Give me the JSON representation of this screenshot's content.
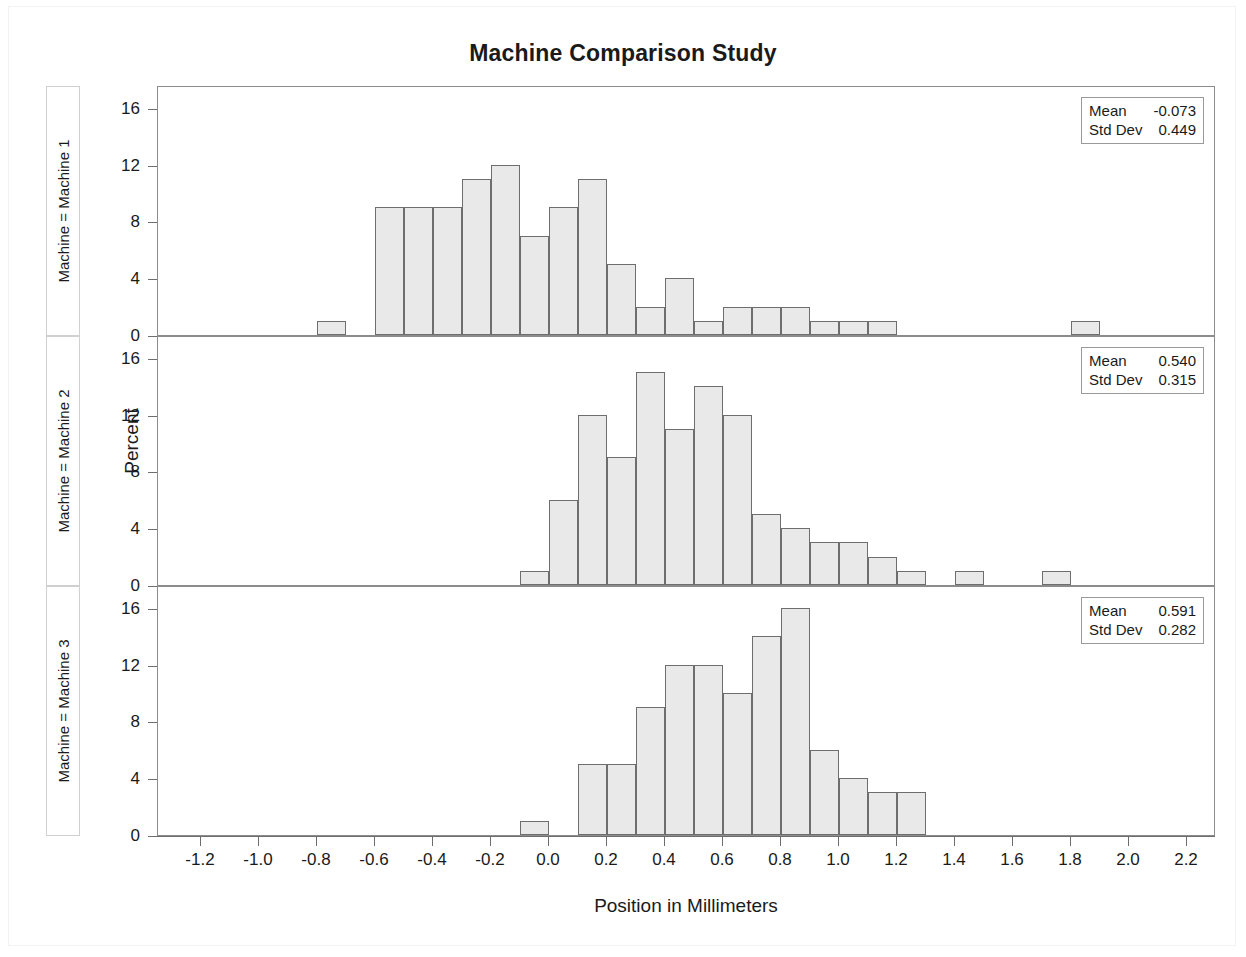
{
  "chart_data": {
    "type": "bar",
    "title": "Machine Comparison Study",
    "xlabel": "Position in Millimeters",
    "ylabel": "Percent",
    "xlim": [
      -1.35,
      2.3
    ],
    "ylim": [
      0,
      17.6
    ],
    "grid": false,
    "legend": "none",
    "bin_width": 0.1,
    "xticks": [
      "-1.2",
      "-1.0",
      "-0.8",
      "-0.6",
      "-0.4",
      "-0.2",
      "0.0",
      "0.2",
      "0.4",
      "0.6",
      "0.8",
      "1.0",
      "1.2",
      "1.4",
      "1.6",
      "1.8",
      "2.0",
      "2.2"
    ],
    "xtick_values": [
      -1.2,
      -1.0,
      -0.8,
      -0.6,
      -0.4,
      -0.2,
      0.0,
      0.2,
      0.4,
      0.6,
      0.8,
      1.0,
      1.2,
      1.4,
      1.6,
      1.8,
      2.0,
      2.2
    ],
    "yticks": [
      "0",
      "4",
      "8",
      "12",
      "16"
    ],
    "ytick_values": [
      0,
      4,
      8,
      12,
      16
    ],
    "panels": [
      {
        "row_label": "Machine = Machine 1",
        "stats": {
          "mean_label": "Mean",
          "mean_value": "-0.073",
          "sd_label": "Std Dev",
          "sd_value": "0.449"
        },
        "bin_centers": [
          -0.75,
          -0.55,
          -0.45,
          -0.35,
          -0.25,
          -0.15,
          -0.05,
          0.05,
          0.15,
          0.25,
          0.35,
          0.45,
          0.55,
          0.65,
          0.75,
          0.85,
          0.95,
          1.05,
          1.15,
          1.85
        ],
        "values": [
          1,
          9,
          9,
          9,
          11,
          12,
          7,
          9,
          11,
          5,
          2,
          4,
          1,
          2,
          2,
          2,
          1,
          1,
          1,
          1
        ]
      },
      {
        "row_label": "Machine = Machine 2",
        "stats": {
          "mean_label": "Mean",
          "mean_value": "0.540",
          "sd_label": "Std Dev",
          "sd_value": "0.315"
        },
        "bin_centers": [
          -0.05,
          0.05,
          0.15,
          0.25,
          0.35,
          0.45,
          0.55,
          0.65,
          0.75,
          0.85,
          0.95,
          1.05,
          1.15,
          1.25,
          1.45,
          1.75
        ],
        "values": [
          1,
          6,
          12,
          9,
          15,
          11,
          14,
          12,
          5,
          4,
          3,
          3,
          2,
          1,
          1,
          1
        ]
      },
      {
        "row_label": "Machine = Machine 3",
        "stats": {
          "mean_label": "Mean",
          "mean_value": "0.591",
          "sd_label": "Std Dev",
          "sd_value": "0.282"
        },
        "bin_centers": [
          -0.05,
          0.15,
          0.25,
          0.35,
          0.45,
          0.55,
          0.65,
          0.75,
          0.85,
          0.95,
          1.05,
          1.15,
          1.25
        ],
        "values": [
          1,
          5,
          5,
          9,
          12,
          12,
          10,
          14,
          16,
          6,
          4,
          3,
          3
        ]
      }
    ]
  }
}
